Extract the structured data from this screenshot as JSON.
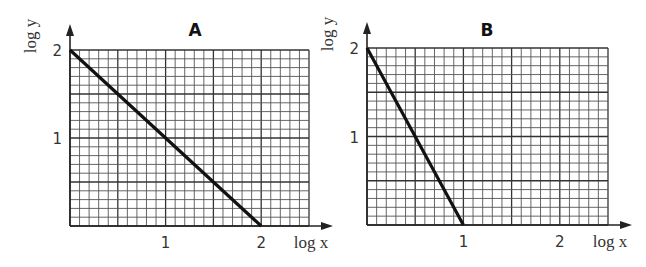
{
  "chart_data": [
    {
      "type": "line",
      "title": "A",
      "xlabel": "log x",
      "ylabel": "log y",
      "xlim": [
        0,
        2.5
      ],
      "ylim": [
        0,
        2
      ],
      "x_ticks": [
        "1",
        "2"
      ],
      "y_ticks": [
        "1",
        "2"
      ],
      "grid": true,
      "grid_minor_step": 0.1,
      "grid_major_step": 0.5,
      "series": [
        {
          "name": "A",
          "x": [
            0,
            2
          ],
          "y": [
            2,
            0
          ],
          "slope": -1,
          "intercept": 2
        }
      ]
    },
    {
      "type": "line",
      "title": "B",
      "xlabel": "log x",
      "ylabel": "log y",
      "xlim": [
        0,
        2.5
      ],
      "ylim": [
        0,
        2
      ],
      "x_ticks": [
        "1",
        "2"
      ],
      "y_ticks": [
        "1",
        "2"
      ],
      "grid": true,
      "grid_minor_step": 0.1,
      "grid_major_step": 0.5,
      "series": [
        {
          "name": "B",
          "x": [
            0,
            1
          ],
          "y": [
            2,
            0
          ],
          "slope": -2,
          "intercept": 2
        }
      ]
    }
  ],
  "labels": {
    "a_title": "A",
    "b_title": "B",
    "xlabel": "log x",
    "ylabel": "log y",
    "tick_1": "1",
    "tick_2": "2"
  }
}
